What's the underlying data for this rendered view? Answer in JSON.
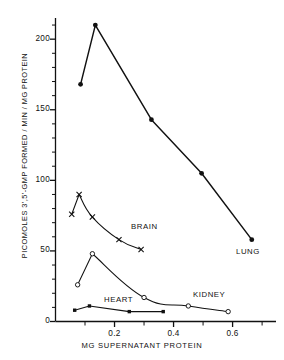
{
  "chart_data": {
    "type": "line",
    "title": "",
    "xlabel": "MG SUPERNATANT PROTEIN",
    "ylabel": "PICOMOLES 3',5'-GMP FORMED / MIN / MG PROTEIN",
    "xlim": [
      0,
      0.72
    ],
    "ylim": [
      0,
      215
    ],
    "grid": false,
    "legend": "inline-labels",
    "x_ticks": [
      0.2,
      0.4,
      0.6
    ],
    "x_tick_labels": [
      "0.2",
      "0.4",
      "0.6"
    ],
    "x_minor_tick_step": 0.1,
    "y_ticks": [
      0,
      50,
      100,
      150,
      200
    ],
    "y_tick_labels": [
      "0",
      "50",
      "100",
      "150",
      "200"
    ],
    "y_minor_tick_step": 10,
    "series": [
      {
        "name": "LUNG",
        "marker": "filled-circle",
        "label": "LUNG",
        "points": [
          {
            "x": 0.085,
            "y": 168
          },
          {
            "x": 0.135,
            "y": 210
          },
          {
            "x": 0.325,
            "y": 143
          },
          {
            "x": 0.495,
            "y": 105
          },
          {
            "x": 0.665,
            "y": 58
          }
        ]
      },
      {
        "name": "BRAIN",
        "marker": "cross",
        "label": "BRAIN",
        "points": [
          {
            "x": 0.055,
            "y": 76
          },
          {
            "x": 0.08,
            "y": 90
          },
          {
            "x": 0.125,
            "y": 74
          },
          {
            "x": 0.215,
            "y": 58
          },
          {
            "x": 0.29,
            "y": 51
          }
        ]
      },
      {
        "name": "KIDNEY",
        "marker": "open-circle",
        "label": "KIDNEY",
        "points": [
          {
            "x": 0.075,
            "y": 26
          },
          {
            "x": 0.125,
            "y": 48
          },
          {
            "x": 0.3,
            "y": 17
          },
          {
            "x": 0.45,
            "y": 11
          },
          {
            "x": 0.585,
            "y": 7
          }
        ]
      },
      {
        "name": "HEART",
        "marker": "filled-square",
        "label": "HEART",
        "points": [
          {
            "x": 0.065,
            "y": 8
          },
          {
            "x": 0.115,
            "y": 11
          },
          {
            "x": 0.25,
            "y": 7
          },
          {
            "x": 0.365,
            "y": 7
          }
        ]
      }
    ],
    "colors": {
      "ink": "#111111",
      "background": "#ffffff"
    }
  },
  "axes": {
    "y_title": "PICOMOLES 3',5'-GMP FORMED / MIN / MG PROTEIN",
    "x_title": "MG SUPERNATANT PROTEIN",
    "y_labels": [
      "200",
      "150",
      "100",
      "50",
      "0"
    ],
    "x_labels": [
      "0.2",
      "0.4",
      "0.6"
    ]
  },
  "series_labels": {
    "lung": "LUNG",
    "brain": "BRAIN",
    "kidney": "KIDNEY",
    "heart": "HEART"
  }
}
